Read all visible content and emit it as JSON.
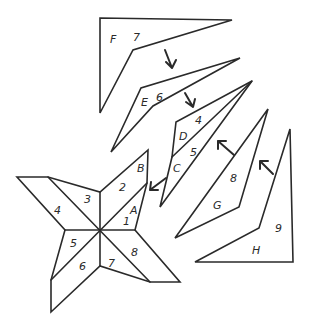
{
  "diagram": {
    "stroke_color": "#2a2a2a",
    "background": "#ffffff"
  },
  "pieces": {
    "F": {
      "letter": "F",
      "number": "7"
    },
    "E": {
      "letter": "E",
      "number": "6"
    },
    "D": {
      "letter": "D",
      "number": "4"
    },
    "C": {
      "letter": "C",
      "number": "5"
    },
    "G": {
      "letter": "G",
      "number": "8"
    },
    "H": {
      "letter": "H",
      "number": "9"
    }
  },
  "star": {
    "labels": {
      "n1": "1",
      "n2": "2",
      "n3": "3",
      "n4": "4",
      "n5": "5",
      "n6": "6",
      "n7": "7",
      "n8": "8",
      "A": "A",
      "B": "B"
    }
  }
}
